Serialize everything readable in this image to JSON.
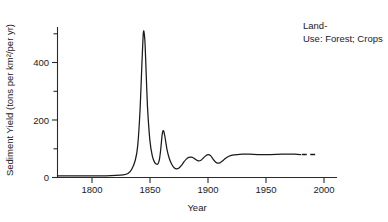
{
  "chart_data": {
    "type": "line",
    "title": "",
    "xlabel": "Year",
    "ylabel": "Sediment Yield (tons per km²/per yr)",
    "xlim": [
      1770,
      2000
    ],
    "ylim": [
      0,
      530
    ],
    "grid": false,
    "legend_position": "none",
    "annotations": [
      {
        "line1": "Land-",
        "line2": "Use: Forest; Crops"
      }
    ],
    "xticks": [
      1800,
      1850,
      1900,
      1950,
      2000
    ],
    "xticklabels": [
      "1800",
      "1850",
      "1900",
      "1950",
      "2000"
    ],
    "yticks_labeled": [
      0,
      200,
      400
    ],
    "yticklabels": [
      "0",
      "200",
      "400"
    ],
    "yticks_minor": [
      100,
      300,
      500
    ],
    "series": [
      {
        "name": "Sediment yield",
        "style": "solid",
        "x": [
          1770,
          1780,
          1790,
          1800,
          1810,
          1818,
          1824,
          1828,
          1831,
          1834,
          1836,
          1838,
          1839.5,
          1840.5,
          1841,
          1842,
          1843,
          1844,
          1846,
          1848,
          1850,
          1852,
          1853,
          1854,
          1855,
          1856,
          1856.8,
          1857.5,
          1858.5,
          1860,
          1862,
          1864,
          1866,
          1868,
          1870,
          1872,
          1874,
          1876,
          1878,
          1880,
          1882,
          1884,
          1886,
          1888,
          1890,
          1892,
          1894,
          1896,
          1898,
          1900,
          1902,
          1904,
          1906,
          1908,
          1911,
          1914,
          1918,
          1922,
          1928,
          1935,
          1945,
          1955,
          1965,
          1970
        ],
        "y": [
          6,
          6,
          6,
          6,
          6,
          7,
          9,
          14,
          28,
          60,
          110,
          240,
          400,
          495,
          510,
          470,
          360,
          250,
          130,
          75,
          52,
          46,
          50,
          66,
          100,
          145,
          163,
          160,
          140,
          100,
          66,
          46,
          34,
          30,
          33,
          42,
          54,
          64,
          70,
          71,
          68,
          62,
          58,
          60,
          68,
          76,
          80,
          76,
          64,
          54,
          50,
          52,
          58,
          66,
          74,
          78,
          80,
          81,
          81,
          80,
          80,
          81,
          81,
          80
        ]
      },
      {
        "name": "Sediment yield (extrapolated)",
        "style": "dashed",
        "x": [
          1971,
          1982
        ],
        "y": [
          80,
          80
        ]
      }
    ]
  }
}
